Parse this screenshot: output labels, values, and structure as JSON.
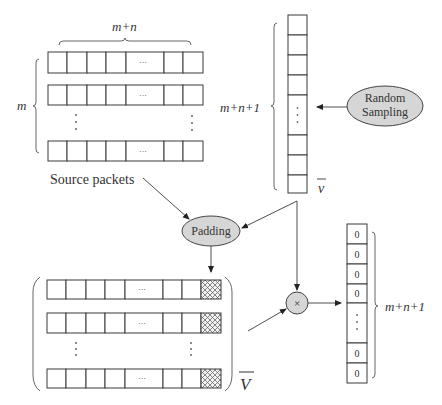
{
  "labels": {
    "top_width": "m+n",
    "top_height": "m",
    "vector_length": "m+n+1",
    "vector_name": "v",
    "source_packets": "Source packets",
    "matrix_name": "V",
    "result_length": "m+n+1",
    "ellipsis": "···"
  },
  "nodes": {
    "random_sampling_line1": "Random",
    "random_sampling_line2": "Sampling",
    "padding": "Padding",
    "multiply": "×"
  },
  "result_vector": {
    "cells": [
      "0",
      "0",
      "0",
      "0",
      "0",
      "0"
    ]
  },
  "colors": {
    "node_fill": "#d6d6d6",
    "stroke": "#3a3a3a",
    "hatch": "#6a6a6a"
  }
}
